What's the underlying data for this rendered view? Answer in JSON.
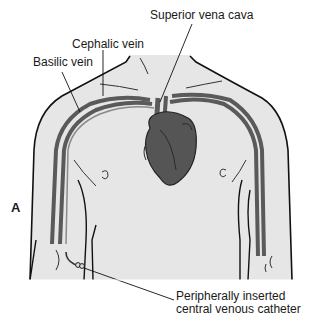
{
  "figure": {
    "panel_letter": "A",
    "labels": {
      "superior_vena_cava": "Superior vena cava",
      "cephalic_vein": "Cephalic vein",
      "basilic_vein": "Basilic vein",
      "picc_line1": "Peripherally inserted",
      "picc_line2": "central venous catheter"
    },
    "colors": {
      "skin": "#e6e6e6",
      "outline": "#111111",
      "vein": "#5a5a5a",
      "vein_light": "#8a8a8a",
      "heart": "#555555",
      "heart_dark": "#3a3a3a"
    }
  }
}
